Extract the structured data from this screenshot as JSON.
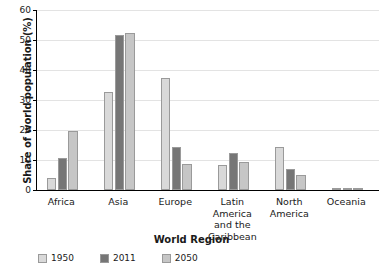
{
  "chart_data": {
    "type": "bar",
    "title": "",
    "xlabel": "World Region",
    "ylabel": "Share of world population (%)",
    "categories": [
      "Africa",
      "Asia",
      "Europe",
      "Latin America\nand the\nCaribbean",
      "North\nAmerica",
      "Oceania"
    ],
    "series": [
      {
        "name": "1950",
        "color": "#d9d9d9",
        "values": [
          4.0,
          32.6,
          37.5,
          8.4,
          14.2,
          0.6
        ]
      },
      {
        "name": "2011",
        "color": "#767676",
        "values": [
          10.8,
          51.6,
          14.5,
          12.4,
          7.1,
          0.5
        ]
      },
      {
        "name": "2050",
        "color": "#c6c6c6",
        "values": [
          19.8,
          52.5,
          8.7,
          9.2,
          5.0,
          0.6
        ]
      }
    ],
    "ylim": [
      0,
      60
    ],
    "yticks": [
      "0",
      "10",
      "20",
      "30",
      "40",
      "50",
      "60"
    ],
    "ytick_values": [
      0,
      10,
      20,
      30,
      40,
      50,
      60
    ],
    "grid": true,
    "grid_axis": "y",
    "legend_position": "bottom-left",
    "axis_color": "#000000",
    "grid_color": "#e3e3e3",
    "background": "#ffffff"
  }
}
